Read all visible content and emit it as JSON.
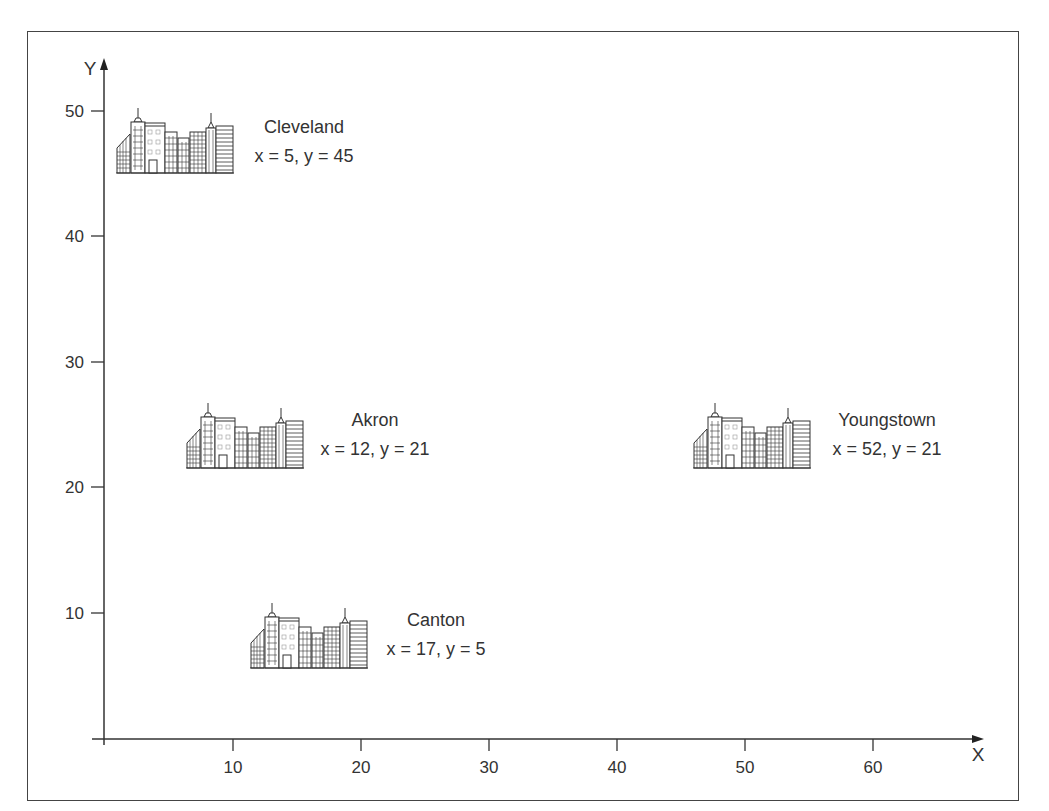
{
  "diagram": {
    "x_axis": {
      "label": "X",
      "ticks": [
        "10",
        "20",
        "30",
        "40",
        "50",
        "60"
      ]
    },
    "y_axis": {
      "label": "Y",
      "ticks": [
        "10",
        "20",
        "30",
        "40",
        "50"
      ]
    },
    "cities": [
      {
        "name": "Cleveland",
        "coords": "x = 5, y = 45",
        "x": 5,
        "y": 45,
        "icon": "city-skyline-icon"
      },
      {
        "name": "Akron",
        "coords": "x = 12, y = 21",
        "x": 12,
        "y": 21,
        "icon": "city-skyline-icon"
      },
      {
        "name": "Youngstown",
        "coords": "x = 52, y = 21",
        "x": 52,
        "y": 21,
        "icon": "city-skyline-icon"
      },
      {
        "name": "Canton",
        "coords": "x = 17, y = 5",
        "x": 17,
        "y": 5,
        "icon": "city-skyline-icon"
      }
    ],
    "colors": {
      "line": "#333333",
      "text": "#333333",
      "frame": "#444444",
      "background": "#ffffff"
    }
  }
}
